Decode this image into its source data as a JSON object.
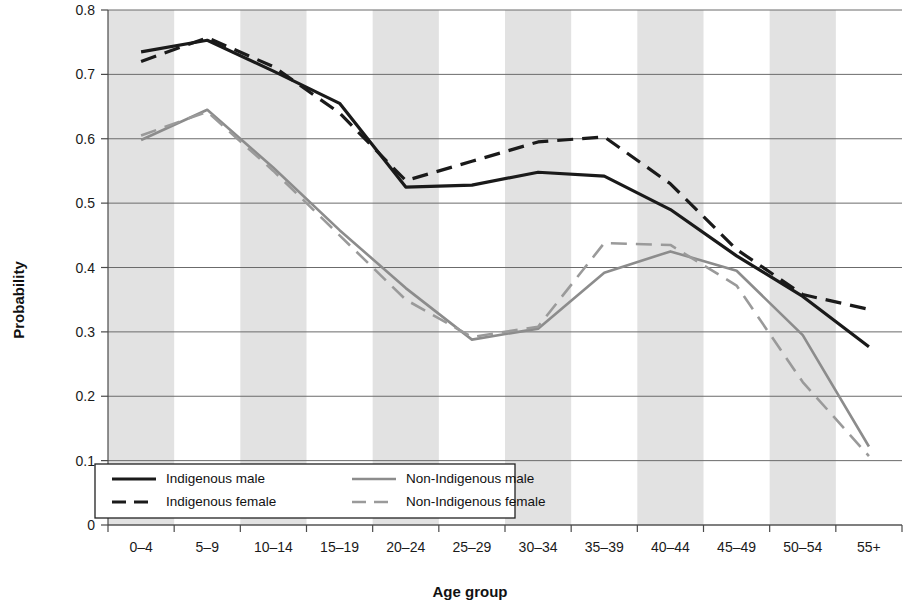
{
  "chart_data": {
    "type": "line",
    "title": "",
    "xlabel": "Age group",
    "ylabel": "Probability",
    "categories": [
      "0–4",
      "5–9",
      "10–14",
      "15–19",
      "20–24",
      "25–29",
      "30–34",
      "35–39",
      "40–44",
      "45–49",
      "50–54",
      "55+"
    ],
    "ylim": [
      0,
      0.8
    ],
    "ytick_labels": [
      "0.8",
      "0.7",
      "0.6",
      "0.5",
      "0.4",
      "0.3",
      "0.2",
      "0.1",
      "0"
    ],
    "ytick_values": [
      0.8,
      0.7,
      0.6,
      0.5,
      0.4,
      0.3,
      0.2,
      0.1,
      0
    ],
    "grid": "horizontal",
    "legend_position": "bottom-left-inside",
    "alternating_vertical_bands": true,
    "series": [
      {
        "name": "Indigenous male",
        "color": "#1a1a1a",
        "dash": "solid",
        "values": [
          0.735,
          0.753,
          0.705,
          0.655,
          0.525,
          0.528,
          0.548,
          0.542,
          0.49,
          0.418,
          0.355,
          0.277
        ]
      },
      {
        "name": "Indigenous female",
        "color": "#1a1a1a",
        "dash": "dashed",
        "values": [
          0.72,
          0.757,
          0.712,
          0.64,
          0.535,
          0.565,
          0.595,
          0.603,
          0.53,
          0.428,
          0.358,
          0.335
        ]
      },
      {
        "name": "Non-Indigenous male",
        "color": "#8c8c8c",
        "dash": "solid",
        "values": [
          0.598,
          0.645,
          0.555,
          0.458,
          0.368,
          0.288,
          0.305,
          0.392,
          0.425,
          0.395,
          0.295,
          0.122
        ]
      },
      {
        "name": "Non-Indigenous female",
        "color": "#9a9a9a",
        "dash": "dashed",
        "values": [
          0.605,
          0.642,
          0.55,
          0.45,
          0.35,
          0.292,
          0.308,
          0.438,
          0.435,
          0.372,
          0.222,
          0.107
        ]
      }
    ]
  },
  "legend": {
    "entries": [
      {
        "label": "Indigenous male"
      },
      {
        "label": "Non-Indigenous male"
      },
      {
        "label": "Indigenous female"
      },
      {
        "label": "Non-Indigenous female"
      }
    ]
  },
  "colors": {
    "indigenous": "#1a1a1a",
    "non_indigenous": "#8c8c8c",
    "band": "#e2e2e2",
    "grid": "#6b6b6b",
    "background": "#ffffff"
  }
}
